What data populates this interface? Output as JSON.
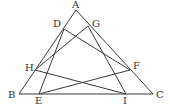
{
  "diagram": {
    "points": {
      "A": {
        "label": "A",
        "x": 76,
        "y": 10,
        "lx": 72,
        "ly": 8
      },
      "B": {
        "label": "B",
        "x": 19,
        "y": 94,
        "lx": 8,
        "ly": 98
      },
      "C": {
        "label": "C",
        "x": 153,
        "y": 94,
        "lx": 156,
        "ly": 98
      },
      "D": {
        "label": "D",
        "x": 64,
        "y": 29,
        "lx": 53,
        "ly": 27
      },
      "G": {
        "label": "G",
        "x": 88,
        "y": 26,
        "lx": 92,
        "ly": 27
      },
      "H": {
        "label": "H",
        "x": 35,
        "y": 70,
        "lx": 25,
        "ly": 71
      },
      "F": {
        "label": "F",
        "x": 130,
        "y": 70,
        "lx": 133,
        "ly": 69
      },
      "E": {
        "label": "E",
        "x": 39,
        "y": 94,
        "lx": 35,
        "ly": 104
      },
      "I": {
        "label": "I",
        "x": 126,
        "y": 94,
        "lx": 123,
        "ly": 104
      }
    },
    "segments": [
      [
        "A",
        "B"
      ],
      [
        "A",
        "C"
      ],
      [
        "B",
        "C"
      ],
      [
        "D",
        "E"
      ],
      [
        "G",
        "H"
      ],
      [
        "D",
        "F"
      ],
      [
        "G",
        "I"
      ],
      [
        "H",
        "I"
      ],
      [
        "E",
        "F"
      ]
    ]
  }
}
